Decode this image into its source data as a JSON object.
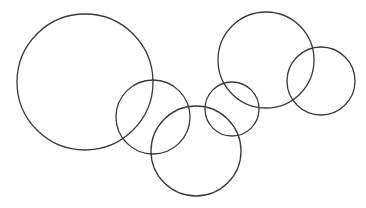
{
  "diagram": {
    "width": 366,
    "height": 208,
    "background": "#ffffff",
    "stroke_color": "#3a3a3a",
    "stroke_width": 1.3,
    "circles": [
      {
        "id": "circle-1",
        "cx": 85,
        "cy": 82,
        "r": 68
      },
      {
        "id": "circle-2",
        "cx": 153,
        "cy": 117,
        "r": 37
      },
      {
        "id": "circle-3",
        "cx": 196,
        "cy": 151,
        "r": 45
      },
      {
        "id": "circle-4",
        "cx": 232,
        "cy": 109,
        "r": 27
      },
      {
        "id": "circle-5",
        "cx": 266,
        "cy": 60,
        "r": 48
      },
      {
        "id": "circle-6",
        "cx": 321,
        "cy": 81,
        "r": 34
      }
    ]
  }
}
